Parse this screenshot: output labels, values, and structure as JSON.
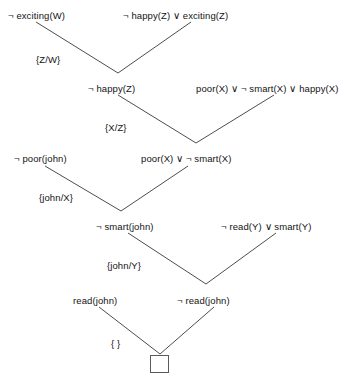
{
  "diagram": {
    "stroke_color": "#4d4d4d",
    "text_color": "#141414",
    "background_color": "#ffffff",
    "clauses": [
      {
        "id": "c1",
        "text": "¬ exciting(W)",
        "x": 8,
        "y": 10
      },
      {
        "id": "c2",
        "text": "¬ happy(Z) ∨ exciting(Z)",
        "x": 123,
        "y": 10
      },
      {
        "id": "c3",
        "text": "¬ happy(Z)",
        "x": 88,
        "y": 83
      },
      {
        "id": "c4",
        "text": "poor(X) ∨ ¬ smart(X) ∨ happy(X)",
        "x": 196,
        "y": 83
      },
      {
        "id": "c5",
        "text": "¬ poor(john)",
        "x": 14,
        "y": 153
      },
      {
        "id": "c6",
        "text": "poor(X) ∨ ¬ smart(X)",
        "x": 141,
        "y": 153
      },
      {
        "id": "c7",
        "text": "¬ smart(john)",
        "x": 96,
        "y": 221
      },
      {
        "id": "c8",
        "text": "¬ read(Y) ∨ smart(Y)",
        "x": 221,
        "y": 221
      },
      {
        "id": "c9",
        "text": "read(john)",
        "x": 73,
        "y": 295
      },
      {
        "id": "c10",
        "text": "¬ read(john)",
        "x": 177,
        "y": 295
      }
    ],
    "substitutions": [
      {
        "id": "s1",
        "text": "{Z/W}",
        "x": 36,
        "y": 54
      },
      {
        "id": "s2",
        "text": "{X/Z}",
        "x": 105,
        "y": 122
      },
      {
        "id": "s3",
        "text": "{john/X}",
        "x": 39,
        "y": 192
      },
      {
        "id": "s4",
        "text": "{john/Y}",
        "x": 107,
        "y": 260
      },
      {
        "id": "s5",
        "text": "{ }",
        "x": 111,
        "y": 338
      }
    ],
    "empty_clause": {
      "label": "empty-clause-box",
      "x": 150,
      "y": 355,
      "width": 19,
      "height": 18
    },
    "edges": [
      {
        "from": "c1",
        "to": "c3",
        "x1": 36,
        "y1": 22,
        "x2": 118,
        "y2": 73
      },
      {
        "from": "c2",
        "to": "c3",
        "x1": 191,
        "y1": 22,
        "x2": 118,
        "y2": 73
      },
      {
        "from": "c3",
        "to": "c6",
        "x1": 118,
        "y1": 95,
        "x2": 196,
        "y2": 143
      },
      {
        "from": "c4",
        "to": "c6",
        "x1": 274,
        "y1": 95,
        "x2": 196,
        "y2": 143
      },
      {
        "from": "c5",
        "to": "c7",
        "x1": 45,
        "y1": 166,
        "x2": 121,
        "y2": 211
      },
      {
        "from": "c6",
        "to": "c7",
        "x1": 188,
        "y1": 166,
        "x2": 121,
        "y2": 211
      },
      {
        "from": "c7",
        "to": "c10",
        "x1": 128,
        "y1": 233,
        "x2": 206,
        "y2": 284
      },
      {
        "from": "c8",
        "to": "c10",
        "x1": 276,
        "y1": 233,
        "x2": 206,
        "y2": 284
      },
      {
        "from": "c9",
        "to": "empty",
        "x1": 99,
        "y1": 307,
        "x2": 160,
        "y2": 354
      },
      {
        "from": "c10",
        "to": "empty",
        "x1": 214,
        "y1": 307,
        "x2": 160,
        "y2": 354
      }
    ]
  }
}
